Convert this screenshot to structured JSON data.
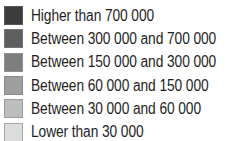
{
  "chart_data": {
    "type": "legend",
    "title": "",
    "legend_position": "standalone",
    "entries": [
      {
        "label": "Higher than 700 000",
        "color": "#3c3c3c",
        "border": "#555555",
        "min": 700000,
        "max": null
      },
      {
        "label": "Between 300 000 and 700 000",
        "color": "#5e5e5e",
        "border": "#747474",
        "min": 300000,
        "max": 700000
      },
      {
        "label": "Between 150 000 and 300 000",
        "color": "#7e7e7e",
        "border": "#909090",
        "min": 150000,
        "max": 300000
      },
      {
        "label": "Between 60 000 and 150 000",
        "color": "#9e9e9e",
        "border": "#8a8a8a",
        "min": 60000,
        "max": 150000
      },
      {
        "label": "Between 30 000 and 60 000",
        "color": "#bdbdbd",
        "border": "#9a9a9a",
        "min": 30000,
        "max": 60000
      },
      {
        "label": "Lower than 30 000",
        "color": "#dcdcdc",
        "border": "#a8a8a8",
        "min": null,
        "max": 30000
      }
    ]
  }
}
